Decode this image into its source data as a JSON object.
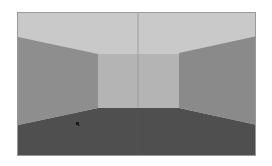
{
  "scene": {
    "type": "first-person-room-view",
    "colors": {
      "ceiling": "#c9c9c9",
      "back_wall": "#b4b4b4",
      "left_wall": "#8e8e8e",
      "right_wall": "#8a8a8a",
      "floor": "#4f4f4f",
      "frame": "#9a9a9a",
      "center_line": "#9c9c9c",
      "marker": "#1a1a1a"
    },
    "geometry": {
      "frame": {
        "x": 0,
        "y": 0,
        "w": 239,
        "h": 144
      },
      "back_wall": {
        "x1": 80,
        "y1": 41,
        "x2": 161,
        "y2": 95
      },
      "left_wall_points": "0,24 80,41 80,95 0,112",
      "right_wall_points": "239,23 161,40 161,95 239,112",
      "center_line_x": 120,
      "marker": {
        "x": 59,
        "y": 110
      }
    }
  }
}
